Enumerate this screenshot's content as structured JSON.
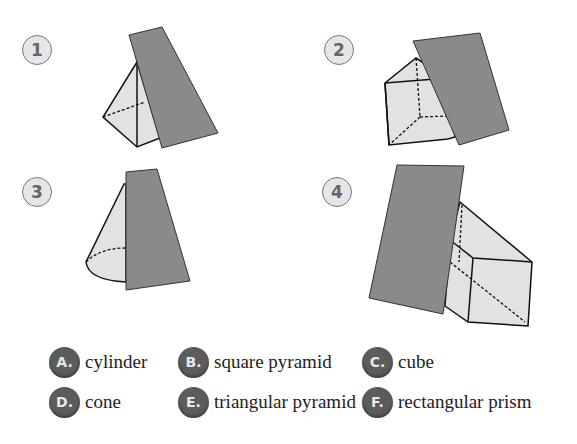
{
  "figures": [
    {
      "number": "1"
    },
    {
      "number": "2"
    },
    {
      "number": "3"
    },
    {
      "number": "4"
    }
  ],
  "options": [
    {
      "letter": "A.",
      "label": "cylinder"
    },
    {
      "letter": "B.",
      "label": "square pyramid"
    },
    {
      "letter": "C.",
      "label": "cube"
    },
    {
      "letter": "D.",
      "label": "cone"
    },
    {
      "letter": "E.",
      "label": "triangular pyramid"
    },
    {
      "letter": "F.",
      "label": "rectangular prism"
    }
  ],
  "colors": {
    "plane": "#8a8a8a",
    "solid": "#e2e2e2",
    "badge": "#5c5c5c"
  }
}
